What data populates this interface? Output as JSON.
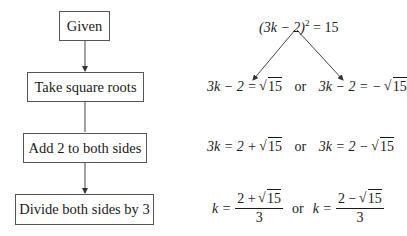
{
  "flowchart": {
    "steps": [
      {
        "label": "Given"
      },
      {
        "label": "Take square roots"
      },
      {
        "label": "Add 2 to both sides"
      },
      {
        "label": "Divide both sides by 3"
      }
    ]
  },
  "equations": {
    "given": {
      "lhs": "(3k − 2)",
      "exp": "2",
      "rhs": "= 15"
    },
    "square_roots": {
      "left": {
        "lhs": "3k − 2 =",
        "radicand": "15"
      },
      "connector": "or",
      "right": {
        "lhs": "3k − 2 = −",
        "radicand": "15"
      }
    },
    "add_two": {
      "left": {
        "lhs": "3k = 2 +",
        "radicand": "15"
      },
      "connector": "or",
      "right": {
        "lhs": "3k = 2 −",
        "radicand": "15"
      }
    },
    "divide_three": {
      "left": {
        "lhs": "k =",
        "num_prefix": "2 +",
        "radicand": "15",
        "den": "3"
      },
      "connector": "or",
      "right": {
        "lhs": "k =",
        "num_prefix": "2 −",
        "radicand": "15",
        "den": "3"
      }
    }
  }
}
